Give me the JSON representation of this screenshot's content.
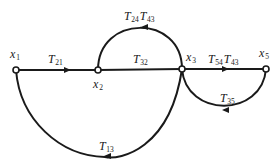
{
  "diagram": {
    "type": "signal-flow-graph",
    "nodes": [
      {
        "id": "x1",
        "base": "x",
        "sub": "1",
        "cx": 16,
        "cy": 70,
        "lx": 10,
        "ly": 58
      },
      {
        "id": "x2",
        "base": "x",
        "sub": "2",
        "cx": 98,
        "cy": 70,
        "lx": 93,
        "ly": 88
      },
      {
        "id": "x3",
        "base": "x",
        "sub": "3",
        "cx": 182,
        "cy": 69,
        "lx": 186,
        "ly": 61
      },
      {
        "id": "x5",
        "base": "x",
        "sub": "5",
        "cx": 266,
        "cy": 69,
        "lx": 259,
        "ly": 57
      }
    ],
    "edges": [
      {
        "id": "e21",
        "from": "x1",
        "to": "x2",
        "label_parts": [
          {
            "base": "T",
            "sub": "21"
          }
        ],
        "lx": 48,
        "ly": 63
      },
      {
        "id": "e32",
        "from": "x2",
        "to": "x3",
        "label_parts": [
          {
            "base": "T",
            "sub": "32"
          }
        ],
        "lx": 133,
        "ly": 63
      },
      {
        "id": "e24_43",
        "from": "x3",
        "to": "x2",
        "label_parts": [
          {
            "base": "T",
            "sub": "24"
          },
          {
            "base": "T",
            "sub": "43"
          }
        ],
        "lx": 124,
        "ly": 20
      },
      {
        "id": "e54_43",
        "from": "x3",
        "to": "x5",
        "label_parts": [
          {
            "base": "T",
            "sub": "54"
          },
          {
            "base": "T",
            "sub": "43"
          }
        ],
        "lx": 208,
        "ly": 63
      },
      {
        "id": "e35",
        "from": "x5",
        "to": "x3",
        "label_parts": [
          {
            "base": "T",
            "sub": "35"
          }
        ],
        "lx": 220,
        "ly": 102
      },
      {
        "id": "e13",
        "from": "x3",
        "to": "x1",
        "label_parts": [
          {
            "base": "T",
            "sub": "13"
          }
        ],
        "lx": 99,
        "ly": 150
      }
    ]
  }
}
